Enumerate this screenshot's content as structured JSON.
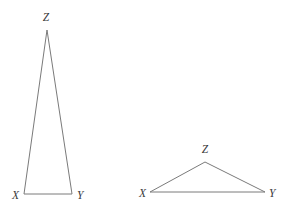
{
  "figure": {
    "canvas": {
      "width": 283,
      "height": 216,
      "background": "#ffffff"
    },
    "style": {
      "stroke_color": "#7a7a7a",
      "stroke_width": 1,
      "label_color": "#3a3a3a",
      "label_font_size": 11.5
    },
    "shapes": [
      {
        "id": "triangle-left",
        "name": "tall-narrow-triangle",
        "polygon_points": "47,30 24,194 72,194",
        "vertices": [
          {
            "key": "Z",
            "label": "Z",
            "x": 47,
            "y": 30,
            "label_x": 46,
            "label_y": 18,
            "anchor": "middle"
          },
          {
            "key": "X",
            "label": "X",
            "x": 24,
            "y": 194,
            "label_x": 19,
            "label_y": 196,
            "anchor": "end"
          },
          {
            "key": "Y",
            "label": "Y",
            "x": 72,
            "y": 194,
            "label_x": 77,
            "label_y": 196,
            "anchor": "start"
          }
        ]
      },
      {
        "id": "triangle-right",
        "name": "wide-flat-triangle",
        "polygon_points": "205,162 150,192 265,192",
        "vertices": [
          {
            "key": "Z",
            "label": "Z",
            "x": 205,
            "y": 162,
            "label_x": 205,
            "label_y": 150,
            "anchor": "middle"
          },
          {
            "key": "X",
            "label": "X",
            "x": 150,
            "y": 192,
            "label_x": 146,
            "label_y": 194,
            "anchor": "end"
          },
          {
            "key": "Y",
            "label": "Y",
            "x": 265,
            "y": 192,
            "label_x": 269,
            "label_y": 194,
            "anchor": "start"
          }
        ]
      }
    ]
  }
}
